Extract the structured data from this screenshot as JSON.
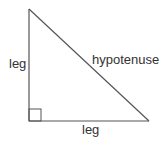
{
  "diagram": {
    "type": "right-triangle",
    "labels": {
      "left_side": "leg",
      "bottom_side": "leg",
      "slanted_side": "hypotenuse"
    },
    "colors": {
      "line": "#555555",
      "text": "#333333"
    }
  }
}
